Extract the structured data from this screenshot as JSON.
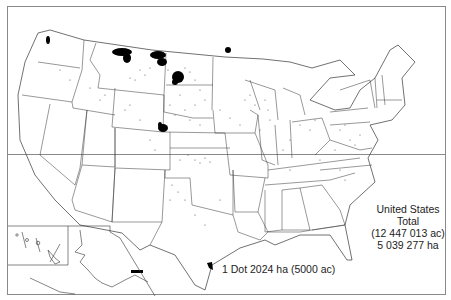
{
  "map": {
    "title": "Dot distribution map of the United States",
    "total": {
      "line1": "United States",
      "line2": "Total",
      "line3": "(12 447 013 ac)",
      "line4": "5 039 277 ha"
    },
    "legend": {
      "dot_value": "1 Dot 2024 ha (5000 ac)"
    },
    "inset": {
      "regions": [
        "Hawaii",
        "Alaska"
      ]
    },
    "colors": {
      "background": "#ffffff",
      "border": "#8a8a8a",
      "state_lines": "#333333",
      "dots": "#000000"
    }
  }
}
